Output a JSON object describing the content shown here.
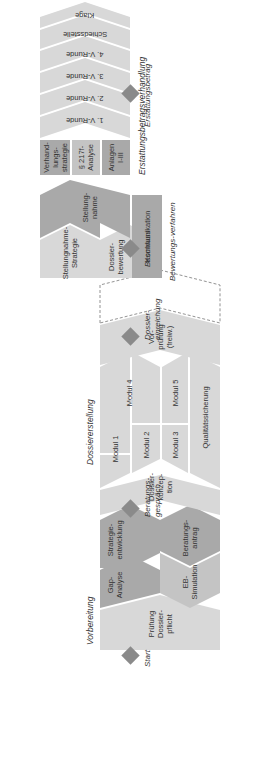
{
  "phases": {
    "vorbereitung": {
      "label": "Vorbereitung",
      "blocks": {
        "pruefung": "Prüfung Dossier-pflicht",
        "gap": "Gap-Analyse",
        "eb": "EB-Simulation",
        "strategie": "Strategie-entwicklung",
        "beratungsantrag": "Beratungs-antrag"
      }
    },
    "dossiererstellung": {
      "label": "Dossiererstellung",
      "blocks": {
        "konzeption": "Dossier-konzep-tion",
        "modul1": "Modul 1",
        "modul2": "Modul 2",
        "modul3": "Modul 3",
        "modul4": "Modul 4",
        "modul5": "Modul 5",
        "qualitaet": "Qualitätssicherung",
        "vorpruefung": "Vor-prüfung (freiw.)"
      }
    },
    "bewertungsverfahren": {
      "label": "Bewertungs-verfahren",
      "blocks": {
        "stellungnahme_strategie": "Stellungnahme-Strategie",
        "dossierbewertung": "Dossier-bewertung",
        "stellungnahme": "Stellung-nahme",
        "kommunikation": "Kommunikation"
      }
    },
    "erstattungsbetragsverhandlung": {
      "label": "Erstattungsbetragsverhandlung",
      "blocks": {
        "verhandlungsstrategie": "Verhand-lungs-strategie",
        "analyse217": "§ 217f-Analyse",
        "anlagen": "Anlagen I-III",
        "runde1": "1. V-Runde",
        "runde2": "2. V-Runde",
        "runde3": "3. V-Runde",
        "runde4": "4. V-Runde",
        "schiedsstelle": "Schiedsstelle",
        "klage": "Klage"
      }
    }
  },
  "milestones": {
    "start": "Start",
    "beratungsgespraech": "Beratungs-gespräch",
    "dossiereinreichung": "Dossier-einreichung",
    "beschluss": "Beschluss",
    "erstattungsbetrag": "Erstattungsbetrag"
  },
  "colors": {
    "light": "#d8d8d8",
    "mid": "#c4c4c4",
    "dark": "#a9a9a9",
    "diamond": "#8a8a8a"
  }
}
